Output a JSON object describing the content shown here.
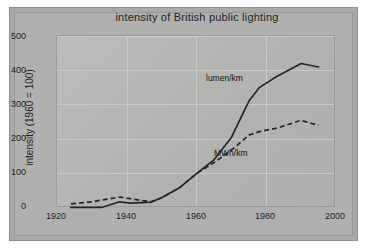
{
  "chart_data": {
    "type": "line",
    "title": "intensity of British public lighting",
    "xlabel": "",
    "ylabel": "intensity (1960 = 100)",
    "xlim": [
      1920,
      2000
    ],
    "ylim": [
      0,
      500
    ],
    "xticks": [
      "1920",
      "1940",
      "1960",
      "1980",
      "2000"
    ],
    "yticks": [
      "0",
      "100",
      "200",
      "300",
      "400",
      "500"
    ],
    "grid": true,
    "legend_position": "inline-annotations",
    "series": [
      {
        "name": "lumen/km",
        "style": "solid",
        "x": [
          1924,
          1933,
          1938,
          1941,
          1947,
          1950,
          1955,
          1960,
          1965,
          1970,
          1975,
          1978,
          1983,
          1990,
          1995
        ],
        "values": [
          2,
          2,
          18,
          14,
          17,
          30,
          58,
          100,
          140,
          205,
          310,
          350,
          382,
          420,
          410
        ]
      },
      {
        "name": "MWh/km",
        "style": "dashed",
        "x": [
          1924,
          1930,
          1938,
          1941,
          1947,
          1950,
          1955,
          1960,
          1965,
          1970,
          1975,
          1978,
          1983,
          1990,
          1995
        ],
        "values": [
          12,
          18,
          32,
          27,
          18,
          30,
          58,
          100,
          132,
          168,
          212,
          222,
          232,
          255,
          240
        ]
      }
    ],
    "annotations": [
      {
        "text": "lumen/km",
        "x": 1972,
        "y": 400
      },
      {
        "text": "MWh/km",
        "x": 1974,
        "y": 178
      }
    ]
  },
  "colors": {
    "outer_background": "#ffffff",
    "frame": "#a9a9a7",
    "plot_background": "#b4b4b2",
    "gridline": "#c9c9c6",
    "line": "#262626",
    "text": "#1d1d1d"
  }
}
